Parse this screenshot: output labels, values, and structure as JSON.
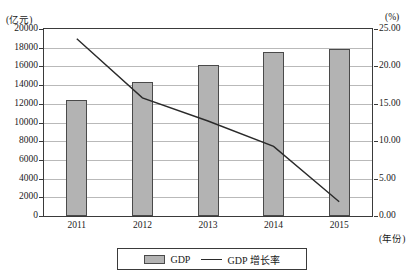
{
  "chart_data": {
    "type": "bar",
    "title": "",
    "categories": [
      "2011",
      "2012",
      "2013",
      "2014",
      "2015"
    ],
    "xlabel": "(年份)",
    "ylabel": "(亿元)",
    "y2label": "(%)",
    "ylim": [
      0,
      20000
    ],
    "y2lim": [
      0,
      25
    ],
    "yticks": [
      "0",
      "2000",
      "4000",
      "6000",
      "8000",
      "10000",
      "12000",
      "14000",
      "16000",
      "18000",
      "20000"
    ],
    "ytick_values": [
      0,
      2000,
      4000,
      6000,
      8000,
      10000,
      12000,
      14000,
      16000,
      18000,
      20000
    ],
    "y2ticks": [
      "0.00",
      "5.00",
      "10.00",
      "15.00",
      "20.00",
      "25.00"
    ],
    "y2tick_values": [
      0,
      5,
      10,
      15,
      20,
      25
    ],
    "grid": true,
    "legend_position": "bottom",
    "series": [
      {
        "name": "GDP",
        "type": "bar",
        "axis": "left",
        "color": "#b3b3b3",
        "values": [
          12400,
          14350,
          16100,
          17550,
          17850
        ]
      },
      {
        "name": "GDP 增长率",
        "type": "line",
        "axis": "right",
        "color": "#2a2a2a",
        "values": [
          23.7,
          15.8,
          12.7,
          9.3,
          1.9
        ]
      }
    ]
  },
  "legend": {
    "bar_label": "GDP",
    "line_label": "GDP 增长率"
  }
}
